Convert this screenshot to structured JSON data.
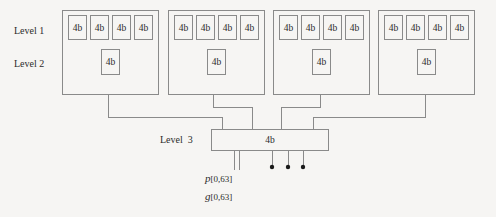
{
  "diagram": {
    "colors": {
      "background": "#f6f5f3",
      "line": "#8a8a8a",
      "text": "#2b2b2b",
      "dot": "#1a1a1a"
    },
    "row_labels": [
      {
        "name": "level-1-label",
        "text": "Level 1",
        "x": 14,
        "y": 25
      },
      {
        "name": "level-2-label",
        "text": "Level 2",
        "x": 14,
        "y": 58
      },
      {
        "name": "level-3-label",
        "text": "Level  3",
        "x": 160,
        "y": 134
      }
    ],
    "groups": [
      {
        "name": "group-1",
        "x": 62,
        "y": 10,
        "w": 97,
        "h": 85,
        "level1_cells": [
          {
            "label": "4b",
            "x": 68,
            "y": 15,
            "w": 19,
            "h": 25
          },
          {
            "label": "4b",
            "x": 90,
            "y": 15,
            "w": 19,
            "h": 25
          },
          {
            "label": "4b",
            "x": 112,
            "y": 15,
            "w": 19,
            "h": 25
          },
          {
            "label": "4b",
            "x": 134,
            "y": 15,
            "w": 19,
            "h": 25
          }
        ],
        "level2_cells": [
          {
            "label": "4b",
            "x": 101,
            "y": 49,
            "w": 19,
            "h": 26
          }
        ]
      },
      {
        "name": "group-2",
        "x": 168,
        "y": 10,
        "w": 97,
        "h": 85,
        "level1_cells": [
          {
            "label": "4b",
            "x": 174,
            "y": 15,
            "w": 19,
            "h": 25
          },
          {
            "label": "4b",
            "x": 196,
            "y": 15,
            "w": 19,
            "h": 25
          },
          {
            "label": "4b",
            "x": 218,
            "y": 15,
            "w": 19,
            "h": 25
          },
          {
            "label": "4b",
            "x": 240,
            "y": 15,
            "w": 19,
            "h": 25
          }
        ],
        "level2_cells": [
          {
            "label": "4b",
            "x": 207,
            "y": 49,
            "w": 19,
            "h": 26
          }
        ]
      },
      {
        "name": "group-3",
        "x": 273,
        "y": 10,
        "w": 97,
        "h": 85,
        "level1_cells": [
          {
            "label": "4b",
            "x": 279,
            "y": 15,
            "w": 19,
            "h": 25
          },
          {
            "label": "4b",
            "x": 301,
            "y": 15,
            "w": 19,
            "h": 25
          },
          {
            "label": "4b",
            "x": 323,
            "y": 15,
            "w": 19,
            "h": 25
          },
          {
            "label": "4b",
            "x": 345,
            "y": 15,
            "w": 19,
            "h": 25
          }
        ],
        "level2_cells": [
          {
            "label": "4b",
            "x": 312,
            "y": 49,
            "w": 19,
            "h": 26
          }
        ]
      },
      {
        "name": "group-4",
        "x": 378,
        "y": 10,
        "w": 97,
        "h": 85,
        "level1_cells": [
          {
            "label": "4b",
            "x": 384,
            "y": 15,
            "w": 19,
            "h": 25
          },
          {
            "label": "4b",
            "x": 406,
            "y": 15,
            "w": 19,
            "h": 25
          },
          {
            "label": "4b",
            "x": 428,
            "y": 15,
            "w": 19,
            "h": 25
          },
          {
            "label": "4b",
            "x": 450,
            "y": 15,
            "w": 19,
            "h": 25
          }
        ],
        "level2_cells": [
          {
            "label": "4b",
            "x": 417,
            "y": 49,
            "w": 19,
            "h": 26
          }
        ]
      }
    ],
    "level3_block": {
      "name": "level-3-block",
      "label": "4b",
      "x": 211,
      "y": 129,
      "w": 118,
      "h": 22
    },
    "bus_routes": [
      {
        "name": "group-1-bus",
        "from_x": 108,
        "drop_y": 117,
        "to_x": 222
      },
      {
        "name": "group-2-bus",
        "from_x": 213,
        "drop_y": 107,
        "to_x": 252
      },
      {
        "name": "group-3-bus",
        "from_x": 320,
        "drop_y": 107,
        "to_x": 281
      },
      {
        "name": "group-4-bus",
        "from_x": 425,
        "drop_y": 117,
        "to_x": 313
      }
    ],
    "outputs": {
      "carry_lines": [
        {
          "name": "p-wire",
          "x": 234,
          "y_end": 170
        },
        {
          "name": "g-wire",
          "x": 239,
          "y_end": 170
        }
      ],
      "dot_lines": [
        {
          "name": "out-wire-1",
          "x": 272,
          "y_end": 167
        },
        {
          "name": "out-wire-2",
          "x": 288,
          "y_end": 167
        },
        {
          "name": "out-wire-3",
          "x": 303,
          "y_end": 167
        }
      ]
    },
    "signals": [
      {
        "name": "signal-p",
        "base": "p",
        "sub": "[0,63]",
        "x": 205,
        "y": 172
      },
      {
        "name": "signal-g",
        "base": "g",
        "sub": "[0,63]",
        "x": 205,
        "y": 190
      }
    ]
  }
}
